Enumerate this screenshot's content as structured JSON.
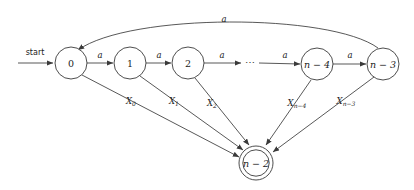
{
  "figure": {
    "type": "finite-automaton-state-diagram",
    "background_color": "#ffffff",
    "stroke_color": "#3a3a3a",
    "text_color": "#1c1c1c"
  },
  "start": {
    "label": "start",
    "arrow_from_x": 18,
    "arrow_to_x": 54,
    "y": 63
  },
  "states": [
    {
      "id": "s0",
      "label": "0",
      "cx": 71,
      "cy": 63,
      "r": 16,
      "accepting": false
    },
    {
      "id": "s1",
      "label": "1",
      "cx": 130,
      "cy": 63,
      "r": 16,
      "accepting": false
    },
    {
      "id": "s2",
      "label": "2",
      "cx": 188,
      "cy": 63,
      "r": 16,
      "accepting": false
    },
    {
      "id": "sn4",
      "label": "n − 4",
      "cx": 317,
      "cy": 64,
      "r": 16,
      "accepting": false
    },
    {
      "id": "sn3",
      "label": "n − 3",
      "cx": 383,
      "cy": 64,
      "r": 16,
      "accepting": false
    },
    {
      "id": "sn2",
      "label": "n − 2",
      "cx": 256,
      "cy": 163,
      "r": 17,
      "r_inner": 13,
      "accepting": true
    }
  ],
  "ellipsis": {
    "glyph": "⋯",
    "cx": 250,
    "cy": 63
  },
  "chain_transitions": [
    {
      "from": "s0",
      "to": "s1",
      "label": "a",
      "label_x": 100,
      "label_y": 55
    },
    {
      "from": "s1",
      "to": "s2",
      "label": "a",
      "label_x": 159,
      "label_y": 55
    },
    {
      "from": "s2",
      "to": "dots",
      "label": "a",
      "label_x": 222,
      "label_y": 55
    },
    {
      "from": "dots",
      "to": "sn4",
      "label": "a",
      "label_x": 285,
      "label_y": 55
    },
    {
      "from": "sn4",
      "to": "sn3",
      "label": "a",
      "label_x": 350,
      "label_y": 55
    }
  ],
  "return_arc": {
    "from": "sn3",
    "to": "s0",
    "label": "a",
    "label_x": 224,
    "label_y": 19
  },
  "accept_transitions": [
    {
      "from": "s0",
      "label_base": "X",
      "label_sub": "0",
      "label_x": 131,
      "label_y": 101
    },
    {
      "from": "s1",
      "label_base": "X",
      "label_sub": "1",
      "label_x": 174,
      "label_y": 101
    },
    {
      "from": "s2",
      "label_base": "X",
      "label_sub": "2",
      "label_x": 212,
      "label_y": 103
    },
    {
      "from": "sn4",
      "label_base": "X",
      "label_sub": "n−4",
      "label_x": 297,
      "label_y": 103
    },
    {
      "from": "sn3",
      "label_base": "X",
      "label_sub": "n−3",
      "label_x": 346,
      "label_y": 101
    }
  ]
}
